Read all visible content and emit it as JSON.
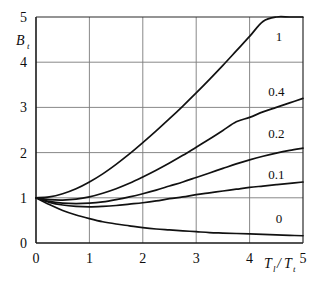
{
  "chart_data": {
    "type": "line",
    "title": "",
    "subtitle": "",
    "xlabel": "T_l/T_t",
    "xlabel_main": "T",
    "ylabel": "B_t",
    "ylabel_main": "B",
    "ylabel_sub": "t",
    "xlim": [
      0,
      5
    ],
    "ylim": [
      0,
      5
    ],
    "grid": true,
    "legend_position": "inline-right",
    "x_ticks": [
      0,
      1,
      2,
      3,
      4,
      5
    ],
    "x_tick_labels": [
      "0",
      "1",
      "2",
      "3",
      "4",
      "5"
    ],
    "y_ticks": [
      0,
      1,
      2,
      3,
      4,
      5
    ],
    "y_tick_labels": [
      "0",
      "1",
      "2",
      "3",
      "4",
      "5"
    ],
    "x": [
      0,
      0.25,
      0.5,
      0.75,
      1,
      1.25,
      1.5,
      1.75,
      2,
      2.25,
      2.5,
      2.75,
      3,
      3.25,
      3.5,
      3.75,
      4,
      4.25,
      4.5,
      4.75,
      5
    ],
    "series": [
      {
        "name": "1",
        "label": "1",
        "label_x": 4.55,
        "label_y": 4.55,
        "values": [
          1.0,
          1.02,
          1.09,
          1.2,
          1.35,
          1.53,
          1.74,
          1.97,
          2.22,
          2.48,
          2.75,
          3.03,
          3.32,
          3.62,
          3.93,
          4.25,
          4.57,
          4.9,
          5.0,
          5.0,
          5.0
        ]
      },
      {
        "name": "0.4",
        "label": "0.4",
        "label_x": 4.5,
        "label_y": 3.35,
        "values": [
          1.0,
          0.96,
          0.95,
          0.97,
          1.02,
          1.1,
          1.2,
          1.32,
          1.46,
          1.61,
          1.77,
          1.94,
          2.12,
          2.3,
          2.49,
          2.68,
          2.78,
          2.9,
          3.0,
          3.1,
          3.2
        ]
      },
      {
        "name": "0.2",
        "label": "0.2",
        "label_x": 4.5,
        "label_y": 2.42,
        "values": [
          1.0,
          0.92,
          0.88,
          0.87,
          0.88,
          0.91,
          0.96,
          1.02,
          1.09,
          1.17,
          1.26,
          1.35,
          1.45,
          1.55,
          1.65,
          1.75,
          1.84,
          1.92,
          1.99,
          2.05,
          2.1
        ]
      },
      {
        "name": "0.1",
        "label": "0.1",
        "label_x": 4.5,
        "label_y": 1.5,
        "values": [
          1.0,
          0.9,
          0.84,
          0.81,
          0.8,
          0.81,
          0.83,
          0.86,
          0.89,
          0.93,
          0.98,
          1.02,
          1.07,
          1.11,
          1.15,
          1.19,
          1.23,
          1.26,
          1.29,
          1.32,
          1.35
        ]
      },
      {
        "name": "0",
        "label": "0",
        "label_x": 4.55,
        "label_y": 0.52,
        "values": [
          1.0,
          0.85,
          0.72,
          0.62,
          0.54,
          0.47,
          0.42,
          0.38,
          0.34,
          0.31,
          0.29,
          0.27,
          0.25,
          0.23,
          0.22,
          0.21,
          0.2,
          0.19,
          0.18,
          0.17,
          0.16
        ]
      }
    ],
    "colors": {
      "curve": "#111111",
      "grid": "#7a7a7a",
      "axis": "#1a1a1a",
      "background": "#ffffff"
    }
  }
}
